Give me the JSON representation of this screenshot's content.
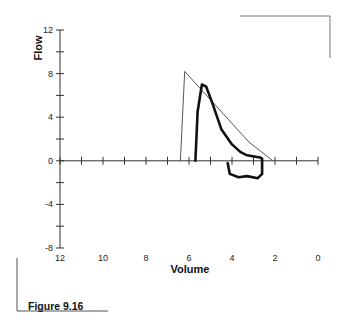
{
  "caption": "Figure 9.16",
  "chart_data": {
    "type": "line",
    "title": "",
    "xlabel": "Volume",
    "ylabel": "Flow",
    "xlim": [
      12,
      0
    ],
    "ylim": [
      -8,
      12
    ],
    "x_reversed": true,
    "x_ticks": [
      12,
      10,
      8,
      6,
      4,
      2,
      0
    ],
    "y_ticks": [
      12,
      8,
      4,
      0,
      -4,
      -8
    ],
    "grid": false,
    "legend": null,
    "series": [
      {
        "name": "predicted",
        "style": "thin",
        "points": [
          [
            6.4,
            0
          ],
          [
            6.2,
            8.2
          ],
          [
            3.2,
            1.7
          ],
          [
            2.1,
            0
          ]
        ]
      },
      {
        "name": "measured",
        "style": "thick",
        "points": [
          [
            5.7,
            0
          ],
          [
            5.6,
            4.5
          ],
          [
            5.4,
            7.0
          ],
          [
            5.2,
            6.8
          ],
          [
            4.9,
            5.2
          ],
          [
            4.5,
            2.9
          ],
          [
            4.0,
            1.5
          ],
          [
            3.6,
            0.8
          ],
          [
            3.3,
            0.5
          ],
          [
            2.7,
            0.3
          ],
          [
            2.6,
            0.2
          ],
          [
            2.6,
            -1.2
          ],
          [
            2.8,
            -1.6
          ],
          [
            3.3,
            -1.4
          ],
          [
            3.7,
            -1.5
          ],
          [
            4.1,
            -1.2
          ],
          [
            4.2,
            -0.2
          ]
        ]
      }
    ]
  }
}
